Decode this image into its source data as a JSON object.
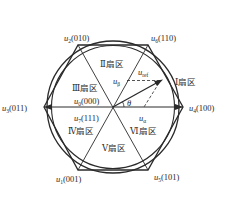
{
  "diagram": {
    "colors": {
      "line": "#2a2a2a",
      "background": "#ffffff"
    },
    "vectors": [
      {
        "id": "u4",
        "base": "u",
        "sub": "4",
        "code": "(100)"
      },
      {
        "id": "u6",
        "base": "u",
        "sub": "6",
        "code": "(110)"
      },
      {
        "id": "u2",
        "base": "u",
        "sub": "2",
        "code": "(010)"
      },
      {
        "id": "u3",
        "base": "u",
        "sub": "3",
        "code": "(011)"
      },
      {
        "id": "u1",
        "base": "u",
        "sub": "1",
        "code": "(001)"
      },
      {
        "id": "u5",
        "base": "u",
        "sub": "5",
        "code": "(101)"
      }
    ],
    "zero_vectors": [
      {
        "id": "u0",
        "base": "u",
        "sub": "0",
        "code": "(000)"
      },
      {
        "id": "u7",
        "base": "u",
        "sub": "7",
        "code": "(111)"
      }
    ],
    "sectors": [
      {
        "id": "I",
        "label": "Ⅰ扇区"
      },
      {
        "id": "II",
        "label": "Ⅱ扇区"
      },
      {
        "id": "III",
        "label": "Ⅲ扇区"
      },
      {
        "id": "IV",
        "label": "Ⅳ扇区"
      },
      {
        "id": "V",
        "label": "Ⅴ扇区"
      },
      {
        "id": "VI",
        "label": "Ⅵ扇区"
      }
    ],
    "reference": {
      "base": "u",
      "sub": "ref"
    },
    "alpha": {
      "base": "u",
      "sub": "α"
    },
    "beta": {
      "base": "u",
      "sub": "β"
    },
    "angle": "θ"
  }
}
